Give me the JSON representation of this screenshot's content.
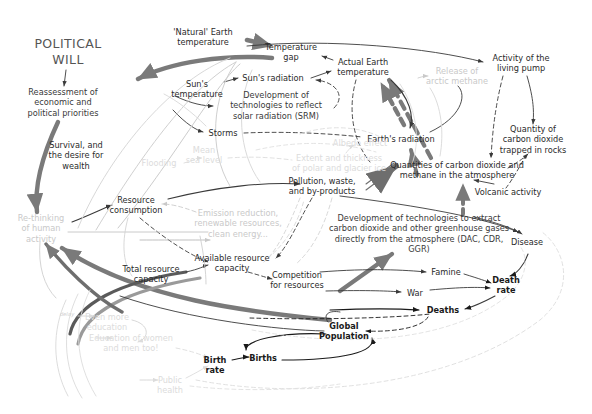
{
  "diagram": {
    "title": "POLITICAL\nWILL",
    "kind": "causal-loop-diagram",
    "palette": {
      "ink": "#3a3a3a",
      "ink_strong": "#2b2b2b",
      "ink_bold": "#1a1a1a",
      "faded": "#c9c9c9",
      "very_faded": "#dcdcdc",
      "thick_arrow": "#7a7a7a",
      "title": "#555555",
      "background": "#ffffff"
    },
    "nodes": [
      {
        "id": "political-will",
        "label": "POLITICAL\nWILL",
        "x": 68,
        "y": 52,
        "w": 96,
        "style": "title"
      },
      {
        "id": "natural-earth-temp",
        "label": "'Natural' Earth\ntemperature",
        "x": 203,
        "y": 37,
        "w": 78,
        "style": "strong"
      },
      {
        "id": "temperature-gap",
        "label": "Temperature\ngap",
        "x": 291,
        "y": 52,
        "w": 66,
        "style": "strong"
      },
      {
        "id": "actual-earth-temp",
        "label": "Actual Earth\ntemperature",
        "x": 363,
        "y": 67,
        "w": 70,
        "style": "strong"
      },
      {
        "id": "activity-living-pump",
        "label": "Activity of the\nliving pump",
        "x": 521,
        "y": 63,
        "w": 78,
        "style": "strong"
      },
      {
        "id": "release-arctic-methane",
        "label": "Release  of\narctic methane",
        "x": 457,
        "y": 76,
        "w": 74,
        "style": "faded"
      },
      {
        "id": "reassessment",
        "label": "Reassessment of\neconomic and\npolitical priorities",
        "x": 63,
        "y": 102,
        "w": 98,
        "style": ""
      },
      {
        "id": "suns-temperature",
        "label": "Sun's\ntemperature",
        "x": 197,
        "y": 89,
        "w": 62,
        "style": "strong"
      },
      {
        "id": "suns-radiation",
        "label": "Sun's radiation",
        "x": 273,
        "y": 78,
        "w": 70,
        "style": "strong"
      },
      {
        "id": "srm",
        "label": "Development of\ntechnologies to reflect\nsolar radiation (SRM)",
        "x": 276,
        "y": 105,
        "w": 112,
        "style": ""
      },
      {
        "id": "earths-radiation",
        "label": "Earth's radiation",
        "x": 401,
        "y": 139,
        "w": 76,
        "style": "strong"
      },
      {
        "id": "quantity-co2-rocks",
        "label": "Quantity of\ncarbon dioxide\ntrapped in rocks",
        "x": 533,
        "y": 139,
        "w": 84,
        "style": "strong"
      },
      {
        "id": "storms",
        "label": "Storms",
        "x": 223,
        "y": 133,
        "w": 38,
        "style": "strong"
      },
      {
        "id": "albedo-effect",
        "label": "Albedo effect",
        "x": 360,
        "y": 143,
        "w": 62,
        "style": "vfaded"
      },
      {
        "id": "mean-sea-level",
        "label": "Mean\nsea level",
        "x": 204,
        "y": 155,
        "w": 44,
        "style": "vfaded"
      },
      {
        "id": "flooding",
        "label": "Flooding",
        "x": 159,
        "y": 163,
        "w": 44,
        "style": "vfaded"
      },
      {
        "id": "polar-glacier-ice",
        "label": "Extent and thickness\nof polar and glacier ice",
        "x": 339,
        "y": 163,
        "w": 100,
        "style": "vfaded"
      },
      {
        "id": "survival-wealth",
        "label": "Survival, and\nthe desire for\nwealth",
        "x": 76,
        "y": 155,
        "w": 72,
        "style": "strong"
      },
      {
        "id": "quantities-co2-ch4",
        "label": "Quantities of carbon dioxide and\nmethane in the atmosphere",
        "x": 457,
        "y": 170,
        "w": 140,
        "style": "strong"
      },
      {
        "id": "volcanic-activity",
        "label": "Volcanic activity",
        "x": 508,
        "y": 192,
        "w": 78,
        "style": "strong"
      },
      {
        "id": "pollution-waste",
        "label": "Pollution, waste,\nand by-products",
        "x": 322,
        "y": 186,
        "w": 80,
        "style": "strong"
      },
      {
        "id": "resource-consumption",
        "label": "Resource\nconsumption",
        "x": 136,
        "y": 205,
        "w": 66,
        "style": "strong"
      },
      {
        "id": "emission-reduction",
        "label": "Emission reduction,\nrenewable resources,\nclean energy...",
        "x": 238,
        "y": 223,
        "w": 104,
        "style": "faded"
      },
      {
        "id": "dac-cdr-ggr",
        "label": "Development of technologies to extract\ncarbon dioxide and other greenhouse gases\ndirectly from the atmosphere (DAC, CDR, GGR)",
        "x": 419,
        "y": 233,
        "w": 182,
        "style": ""
      },
      {
        "id": "rethinking-human",
        "label": "Re-thinking\nof human\nactivity",
        "x": 41,
        "y": 228,
        "w": 62,
        "style": "faded"
      },
      {
        "id": "disease",
        "label": "Disease",
        "x": 527,
        "y": 242,
        "w": 42,
        "style": "strong"
      },
      {
        "id": "available-resource",
        "label": "Available resource\ncapacity",
        "x": 232,
        "y": 263,
        "w": 84,
        "style": "strong"
      },
      {
        "id": "total-resource",
        "label": "Total resource\ncapacity",
        "x": 151,
        "y": 274,
        "w": 70,
        "style": "strong"
      },
      {
        "id": "competition",
        "label": "Competition\nfor resources",
        "x": 297,
        "y": 280,
        "w": 66,
        "style": "strong"
      },
      {
        "id": "famine",
        "label": "Famine",
        "x": 446,
        "y": 272,
        "w": 38,
        "style": "strong"
      },
      {
        "id": "death-rate",
        "label": "Death\nrate",
        "x": 506,
        "y": 285,
        "w": 36,
        "style": "bold"
      },
      {
        "id": "war",
        "label": "War",
        "x": 415,
        "y": 293,
        "w": 26,
        "style": "strong"
      },
      {
        "id": "deaths",
        "label": "Deaths",
        "x": 443,
        "y": 310,
        "w": 36,
        "style": "bold"
      },
      {
        "id": "delay-label",
        "label": "delay",
        "x": 67,
        "y": 314,
        "w": 24,
        "style": "tiny"
      },
      {
        "id": "even-more-education",
        "label": "Even more\neducation",
        "x": 107,
        "y": 322,
        "w": 54,
        "style": "vfaded"
      },
      {
        "id": "global-population",
        "label": "Global\nPopulation",
        "x": 344,
        "y": 331,
        "w": 56,
        "style": "bold"
      },
      {
        "id": "education-women",
        "label": "Education of women\nand men too!",
        "x": 131,
        "y": 343,
        "w": 90,
        "style": "vfaded"
      },
      {
        "id": "births",
        "label": "Births",
        "x": 263,
        "y": 358,
        "w": 34,
        "style": "bold"
      },
      {
        "id": "birth-rate",
        "label": "Birth\nrate",
        "x": 215,
        "y": 365,
        "w": 32,
        "style": "bold"
      },
      {
        "id": "public-health",
        "label": "Public\nhealth",
        "x": 170,
        "y": 385,
        "w": 38,
        "style": "vfaded"
      }
    ],
    "edge_count": 48
  }
}
